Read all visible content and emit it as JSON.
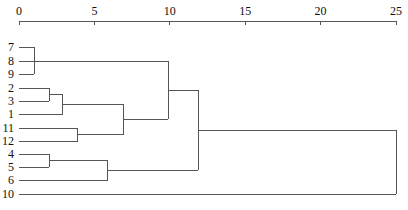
{
  "chart_data": {
    "type": "dendrogram",
    "title": "",
    "xlabel": "",
    "ylabel": "",
    "xlim": [
      0,
      25
    ],
    "x_ticks": [
      "0",
      "5",
      "10",
      "15",
      "20",
      "25"
    ],
    "leaf_order": [
      "7",
      "8",
      "9",
      "2",
      "3",
      "1",
      "11",
      "12",
      "4",
      "5",
      "6",
      "10"
    ],
    "merges": [
      {
        "members": [
          "7",
          "8",
          "9"
        ],
        "distance": 1.0
      },
      {
        "members": [
          "2",
          "3"
        ],
        "distance": 2.0
      },
      {
        "members": [
          "2,3",
          "1"
        ],
        "distance": 2.9
      },
      {
        "members": [
          "11",
          "12"
        ],
        "distance": 3.9
      },
      {
        "members": [
          "2,3,1",
          "11,12"
        ],
        "distance": 6.9
      },
      {
        "members": [
          "4",
          "5"
        ],
        "distance": 2.0
      },
      {
        "members": [
          "4,5",
          "6"
        ],
        "distance": 5.9
      },
      {
        "members": [
          "7,8,9",
          "2,3,1,11,12"
        ],
        "distance": 9.9
      },
      {
        "members": [
          "7,8,9,2,3,1,11,12",
          "4,5,6"
        ],
        "distance": 11.9
      },
      {
        "members": [
          "all",
          "10"
        ],
        "distance": 25.0
      }
    ],
    "grid": false,
    "legend": null
  }
}
